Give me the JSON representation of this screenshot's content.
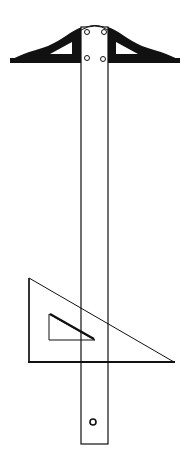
{
  "illustration": {
    "subject": "T-square with set square (triangle)",
    "colors": {
      "ink": "#111111",
      "background": "#ffffff"
    },
    "parts": [
      "t-square-head",
      "t-square-blade",
      "hanging-hole",
      "set-square-triangle",
      "triangle-cutout"
    ]
  }
}
